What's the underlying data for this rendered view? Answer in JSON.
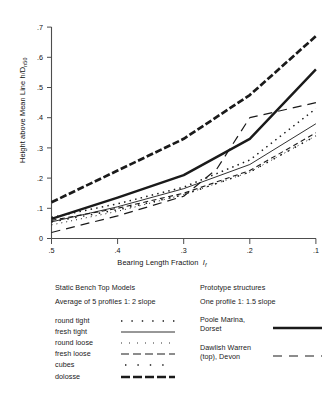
{
  "chart_data": {
    "type": "line",
    "title": "",
    "xlabel": "Bearing Length Fraction I",
    "xlabel_sub": "f",
    "ylabel": "Height above Mean Line   h/D",
    "ylabel_sub": "n50",
    "xlim": [
      0.5,
      0.1
    ],
    "ylim": [
      0.0,
      0.7
    ],
    "x_reversed": true,
    "grid": false,
    "legend_position": "below",
    "xticks": [
      ".5",
      ".4",
      ".3",
      ".2",
      ".1"
    ],
    "xtick_values": [
      0.5,
      0.4,
      0.3,
      0.2,
      0.1
    ],
    "yticks": [
      "0",
      ".1",
      ".2",
      ".3",
      ".4",
      ".5",
      ".6",
      ".7"
    ],
    "ytick_values": [
      0,
      0.1,
      0.2,
      0.3,
      0.4,
      0.5,
      0.6,
      0.7
    ],
    "series": [
      {
        "name": "round tight",
        "style": "dotted",
        "group": "Static Bench Top Models",
        "x": [
          0.5,
          0.4,
          0.3,
          0.2,
          0.1
        ],
        "y": [
          0.07,
          0.115,
          0.17,
          0.26,
          0.43
        ]
      },
      {
        "name": "fresh tight",
        "style": "solid-thin",
        "group": "Static Bench Top Models",
        "x": [
          0.5,
          0.4,
          0.3,
          0.2,
          0.1
        ],
        "y": [
          0.055,
          0.105,
          0.165,
          0.245,
          0.38
        ]
      },
      {
        "name": "round loose",
        "style": "fine-dotted",
        "group": "Static Bench Top Models",
        "x": [
          0.5,
          0.4,
          0.3,
          0.2,
          0.1
        ],
        "y": [
          0.045,
          0.09,
          0.145,
          0.22,
          0.34
        ]
      },
      {
        "name": "fresh loose",
        "style": "dashed",
        "group": "Static Bench Top Models",
        "x": [
          0.5,
          0.4,
          0.3,
          0.2,
          0.1
        ],
        "y": [
          0.06,
          0.1,
          0.15,
          0.225,
          0.35
        ]
      },
      {
        "name": "cubes",
        "style": "sparse-dotted",
        "group": "Static Bench Top Models",
        "x": [
          0.5,
          0.4,
          0.3,
          0.2,
          0.1
        ],
        "y": [
          0.055,
          0.095,
          0.145,
          0.22,
          0.34
        ]
      },
      {
        "name": "dolosse",
        "style": "thick-dashed",
        "group": "Static Bench Top Models",
        "x": [
          0.5,
          0.4,
          0.3,
          0.2,
          0.1
        ],
        "y": [
          0.12,
          0.225,
          0.33,
          0.475,
          0.67
        ]
      },
      {
        "name": "Poole Marina, Dorset",
        "style": "thick-solid",
        "group": "Prototype structures",
        "x": [
          0.5,
          0.4,
          0.3,
          0.2,
          0.1
        ],
        "y": [
          0.065,
          0.135,
          0.21,
          0.33,
          0.56
        ]
      },
      {
        "name": "Dawlish Warren (top), Devon",
        "style": "long-dashed",
        "group": "Prototype structures",
        "x": [
          0.5,
          0.4,
          0.3,
          0.25,
          0.2,
          0.1
        ],
        "y": [
          0.02,
          0.075,
          0.14,
          0.23,
          0.4,
          0.45
        ]
      }
    ]
  },
  "axis": {
    "ylabel_main": "Height above Mean Line   h/D",
    "ylabel_subscript": "n50",
    "xlabel_main": "Bearing Length Fraction",
    "xlabel_symbol": "I",
    "xlabel_subscript": "f",
    "xticks": [
      ".5",
      ".4",
      ".3",
      ".2",
      ".1"
    ],
    "yticks": [
      ".7",
      ".6",
      ".5",
      ".4",
      ".3",
      ".2",
      ".1",
      "0"
    ]
  },
  "legend": {
    "left": {
      "heading1": "Static Bench Top Models",
      "heading2": "Average of 5 profiles  1: 2 slope",
      "items": [
        {
          "label": "round tight",
          "style": "dotted"
        },
        {
          "label": "fresh tight",
          "style": "solid-thin"
        },
        {
          "label": "round loose",
          "style": "fine-dotted"
        },
        {
          "label": "fresh loose",
          "style": "dashed"
        },
        {
          "label": "cubes",
          "style": "sparse-dotted"
        },
        {
          "label": "dolosse",
          "style": "thick-dashed"
        }
      ]
    },
    "right": {
      "heading1": "Prototype structures",
      "heading2": "One profile 1: 1.5 slope",
      "items": [
        {
          "line1": "Poole Marina,",
          "line2": "Dorset",
          "style": "thick-solid"
        },
        {
          "line1": "Dawlish Warren",
          "line2": "(top),  Devon",
          "style": "long-dashed"
        }
      ]
    }
  },
  "colors": {
    "axis": "#4d4d4d",
    "line": "#1a1a1a",
    "background": "#ffffff"
  }
}
